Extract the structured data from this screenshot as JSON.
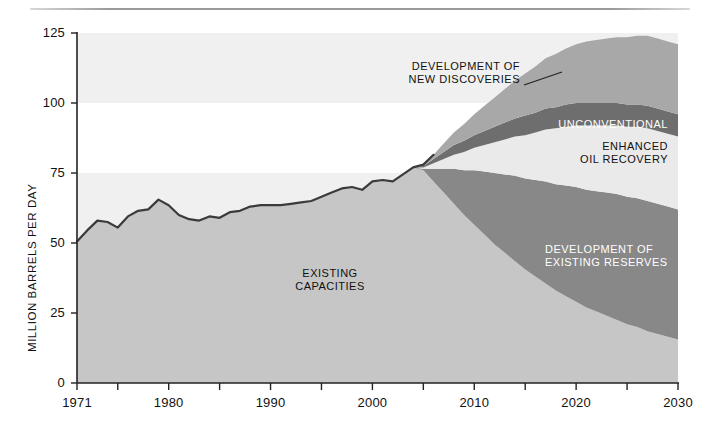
{
  "figure": {
    "axis_color": "#222222",
    "rule_color": "#9a9a9a"
  },
  "chart_data": {
    "type": "area",
    "title": "",
    "subtitle": "",
    "xlabel": "",
    "ylabel": "MILLION BARRELS PER DAY",
    "xlim": [
      1971,
      2030
    ],
    "ylim": [
      0,
      125
    ],
    "grid": false,
    "legend_position": "inline-annotations",
    "stacked": true,
    "y_ticks": [
      0,
      25,
      50,
      75,
      100,
      125
    ],
    "y_tick_labels": [
      "0",
      "25",
      "50",
      "75",
      "100",
      "125"
    ],
    "x_ticks_major": [
      1971,
      1980,
      1990,
      2000,
      2010,
      2020,
      2030
    ],
    "x_tick_labels": [
      "1971",
      "1980",
      "1990",
      "2000",
      "2010",
      "2020",
      "2030"
    ],
    "x_ticks_minor": [
      1975,
      1985,
      1995,
      2005,
      2015,
      2025
    ],
    "background_bands": [
      {
        "from": 100,
        "to": 125,
        "color": "#f0f0f0"
      },
      {
        "from": 75,
        "to": 100,
        "color": "#ffffff"
      },
      {
        "from": 50,
        "to": 75,
        "color": "#f0f0f0"
      },
      {
        "from": 0,
        "to": 50,
        "color": "#ffffff"
      }
    ],
    "x": [
      1971,
      1972,
      1973,
      1974,
      1975,
      1976,
      1977,
      1978,
      1979,
      1980,
      1981,
      1982,
      1983,
      1984,
      1985,
      1986,
      1987,
      1988,
      1989,
      1990,
      1991,
      1992,
      1993,
      1994,
      1995,
      1996,
      1997,
      1998,
      1999,
      2000,
      2001,
      2002,
      2003,
      2004,
      2005,
      2006,
      2007,
      2008,
      2009,
      2010,
      2011,
      2012,
      2013,
      2014,
      2015,
      2016,
      2017,
      2018,
      2019,
      2020,
      2021,
      2022,
      2023,
      2024,
      2025,
      2026,
      2027,
      2028,
      2029,
      2030
    ],
    "series": [
      {
        "name": "EXISTING CAPACITIES",
        "color": "#c6c6c6",
        "values": [
          50.5,
          54.5,
          58.0,
          57.5,
          55.5,
          59.5,
          61.5,
          62.0,
          65.5,
          63.5,
          60.0,
          58.5,
          58.0,
          59.5,
          59.0,
          61.0,
          61.5,
          63.0,
          63.5,
          63.5,
          63.5,
          64.0,
          64.5,
          65.0,
          66.5,
          68.0,
          69.5,
          70.0,
          69.0,
          72.0,
          72.5,
          72.0,
          74.5,
          77.0,
          76.0,
          72.0,
          68.0,
          64.0,
          60.0,
          56.5,
          53.0,
          49.5,
          46.5,
          43.5,
          40.5,
          38.0,
          35.5,
          33.0,
          31.0,
          29.0,
          27.0,
          25.5,
          24.0,
          22.5,
          21.0,
          20.0,
          18.5,
          17.5,
          16.5,
          15.5
        ]
      },
      {
        "name": "DEVELOPMENT OF EXISTING RESERVES",
        "color": "#888888",
        "values": [
          0,
          0,
          0,
          0,
          0,
          0,
          0,
          0,
          0,
          0,
          0,
          0,
          0,
          0,
          0,
          0,
          0,
          0,
          0,
          0,
          0,
          0,
          0,
          0,
          0,
          0,
          0,
          0,
          0,
          0,
          0,
          0,
          0,
          0,
          0.5,
          4.5,
          8.5,
          12.5,
          16.0,
          19.5,
          22.5,
          25.5,
          28.0,
          30.5,
          32.5,
          34.5,
          36.5,
          38.0,
          39.5,
          41.0,
          42.0,
          43.0,
          44.0,
          45.0,
          45.5,
          46.0,
          46.5,
          46.5,
          46.5,
          46.5
        ]
      },
      {
        "name": "ENHANCED OIL RECOVERY",
        "color": "#eaeaea",
        "values": [
          0,
          0,
          0,
          0,
          0,
          0,
          0,
          0,
          0,
          0,
          0,
          0,
          0,
          0,
          0,
          0,
          0,
          0,
          0,
          0,
          0,
          0,
          0,
          0,
          0,
          0,
          0,
          0,
          0,
          0,
          0,
          0,
          0,
          0,
          0.5,
          2.0,
          3.5,
          5.0,
          6.5,
          8.0,
          9.5,
          11.0,
          12.5,
          14.0,
          15.5,
          17.0,
          18.5,
          20.0,
          21.0,
          22.0,
          23.0,
          23.5,
          24.0,
          24.5,
          25.0,
          25.5,
          26.0,
          26.0,
          26.0,
          26.0
        ]
      },
      {
        "name": "UNCONVENTIONAL",
        "color": "#6e6e6e",
        "values": [
          0,
          0,
          0,
          0,
          0,
          0,
          0,
          0,
          0,
          0,
          0,
          0,
          0,
          0,
          0,
          0,
          0,
          0,
          0,
          0,
          0,
          0,
          0,
          0,
          0,
          0,
          0,
          0,
          0,
          0,
          0,
          0,
          0,
          0,
          0.5,
          1.5,
          2.5,
          3.5,
          4.0,
          4.5,
          5.0,
          5.5,
          6.0,
          6.5,
          7.0,
          7.0,
          7.5,
          7.5,
          8.0,
          8.0,
          8.0,
          8.0,
          8.0,
          8.0,
          8.0,
          8.0,
          8.0,
          8.0,
          8.0,
          8.0
        ]
      },
      {
        "name": "DEVELOPMENT OF NEW DISCOVERIES",
        "color": "#a8a8a8",
        "values": [
          0,
          0,
          0,
          0,
          0,
          0,
          0,
          0,
          0,
          0,
          0,
          0,
          0,
          0,
          0,
          0,
          0,
          0,
          0,
          0,
          0,
          0,
          0,
          0,
          0,
          0,
          0,
          0,
          0,
          0,
          0,
          0,
          0,
          0,
          0.5,
          1.5,
          3.0,
          4.5,
          6.0,
          7.5,
          9.0,
          10.5,
          12.0,
          13.5,
          15.0,
          16.5,
          18.0,
          19.0,
          20.0,
          21.0,
          22.0,
          22.5,
          23.0,
          23.5,
          24.0,
          24.5,
          25.0,
          25.0,
          25.0,
          25.0
        ]
      }
    ],
    "annotations": [
      {
        "id": "new-discoveries",
        "text_lines": [
          "DEVELOPMENT OF",
          "NEW DISCOVERIES"
        ],
        "color": "#111111",
        "leader_line": true
      },
      {
        "id": "unconventional",
        "text_lines": [
          "UNCONVENTIONAL"
        ],
        "color": "#ffffff",
        "leader_line": false
      },
      {
        "id": "enhanced-oil-recovery",
        "text_lines": [
          "ENHANCED",
          "OIL RECOVERY"
        ],
        "color": "#111111",
        "leader_line": false
      },
      {
        "id": "existing-reserves",
        "text_lines": [
          "DEVELOPMENT OF",
          "EXISTING RESERVES"
        ],
        "color": "#ffffff",
        "leader_line": false
      },
      {
        "id": "existing-capacities",
        "text_lines": [
          "EXISTING",
          "CAPACITIES"
        ],
        "color": "#111111",
        "leader_line": false
      }
    ]
  },
  "labels": {
    "y_axis_title": "MILLION BARRELS PER DAY",
    "annot_new_discoveries_l1": "DEVELOPMENT OF",
    "annot_new_discoveries_l2": "NEW DISCOVERIES",
    "annot_unconventional": "UNCONVENTIONAL",
    "annot_eor_l1": "ENHANCED",
    "annot_eor_l2": "OIL RECOVERY",
    "annot_existing_reserves_l1": "DEVELOPMENT OF",
    "annot_existing_reserves_l2": "EXISTING RESERVES",
    "annot_existing_capacities_l1": "EXISTING",
    "annot_existing_capacities_l2": "CAPACITIES"
  }
}
